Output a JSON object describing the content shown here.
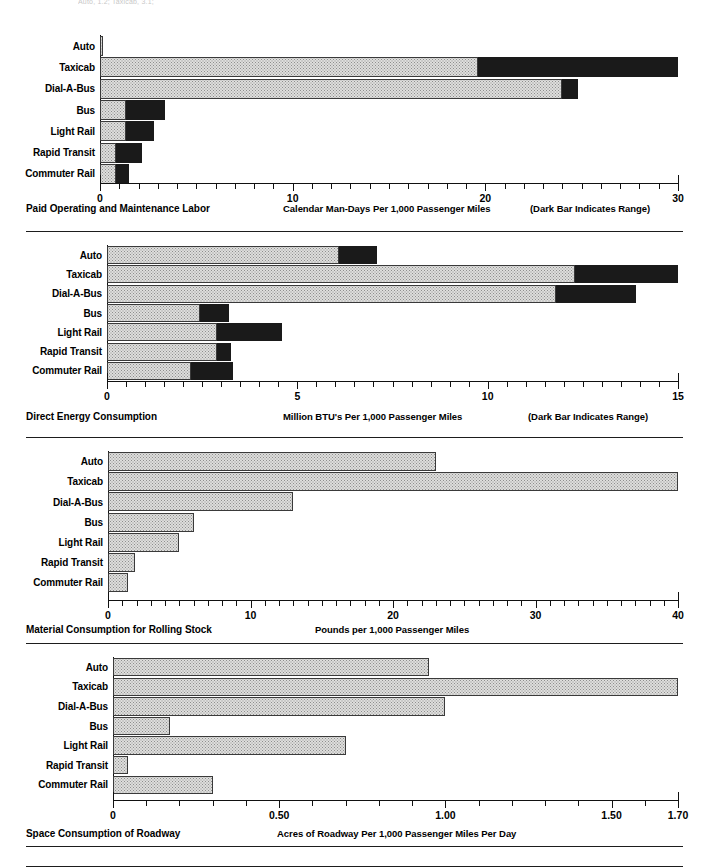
{
  "page": {
    "top_fragment": "Auto, 1.2; Taxicab, 3.1;"
  },
  "categories": [
    "Auto",
    "Taxicab",
    "Dial-A-Bus",
    "Bus",
    "Light Rail",
    "Rapid Transit",
    "Commuter Rail"
  ],
  "legend_note": "(Dark Bar Indicates Range)",
  "chart_data": [
    {
      "type": "bar",
      "orientation": "horizontal",
      "title": "Paid Operating and Maintenance Labor",
      "xlabel": "Calendar Man-Days Per 1,000 Passenger Miles",
      "legend_note": "(Dark Bar Indicates Range)",
      "ylabel": "",
      "xlim": [
        0,
        30
      ],
      "xticks": [
        0,
        10,
        20,
        30
      ],
      "xtick_labels": [
        "0",
        "10",
        "20",
        "30"
      ],
      "minor_tick_step": 1,
      "grid": false,
      "categories": [
        "Auto",
        "Taxicab",
        "Dial-A-Bus",
        "Bus",
        "Light Rail",
        "Rapid Transit",
        "Commuter Rail"
      ],
      "series": [
        {
          "name": "Low (light bar)",
          "values": [
            0.1,
            19.6,
            24.0,
            1.35,
            1.35,
            0.85,
            0.85
          ]
        },
        {
          "name": "High (dark bar end)",
          "values": [
            0.1,
            30.0,
            24.8,
            3.4,
            2.8,
            2.2,
            1.5
          ]
        }
      ]
    },
    {
      "type": "bar",
      "orientation": "horizontal",
      "title": "Direct Energy Consumption",
      "xlabel": "Million BTU's Per 1,000 Passenger Miles",
      "legend_note": "(Dark Bar Indicates Range)",
      "ylabel": "",
      "xlim": [
        0,
        15
      ],
      "xticks": [
        0,
        5,
        10,
        15
      ],
      "xtick_labels": [
        "0",
        "5",
        "10",
        "15"
      ],
      "minor_tick_step": 0.5,
      "grid": false,
      "categories": [
        "Auto",
        "Taxicab",
        "Dial-A-Bus",
        "Bus",
        "Light Rail",
        "Rapid Transit",
        "Commuter Rail"
      ],
      "series": [
        {
          "name": "Low (light bar)",
          "values": [
            6.1,
            12.3,
            11.8,
            2.45,
            2.9,
            2.9,
            2.2
          ]
        },
        {
          "name": "High (dark bar end)",
          "values": [
            7.1,
            15.0,
            13.9,
            3.2,
            4.6,
            3.25,
            3.3
          ]
        }
      ]
    },
    {
      "type": "bar",
      "orientation": "horizontal",
      "title": "Material Consumption for Rolling Stock",
      "xlabel": "Pounds per 1,000 Passenger Miles",
      "legend_note": "",
      "ylabel": "",
      "xlim": [
        0,
        40
      ],
      "xticks": [
        0,
        10,
        20,
        30,
        40
      ],
      "xtick_labels": [
        "0",
        "10",
        "20",
        "30",
        "40"
      ],
      "minor_tick_step": 1,
      "grid": false,
      "categories": [
        "Auto",
        "Taxicab",
        "Dial-A-Bus",
        "Bus",
        "Light Rail",
        "Rapid Transit",
        "Commuter Rail"
      ],
      "series": [
        {
          "name": "Value",
          "values": [
            23.0,
            40.0,
            13.0,
            6.0,
            5.0,
            1.9,
            1.4
          ]
        }
      ]
    },
    {
      "type": "bar",
      "orientation": "horizontal",
      "title": "Space Consumption of Roadway",
      "xlabel": "Acres of Roadway Per 1,000 Passenger Miles Per Day",
      "legend_note": "",
      "ylabel": "",
      "xlim": [
        0,
        1.7
      ],
      "xticks": [
        0,
        0.5,
        1.0,
        1.5,
        1.7
      ],
      "xtick_labels": [
        "0",
        "0.50",
        "1.00",
        "1.50",
        "1.70"
      ],
      "minor_tick_step": 0.1,
      "grid": false,
      "categories": [
        "Auto",
        "Taxicab",
        "Dial-A-Bus",
        "Bus",
        "Light Rail",
        "Rapid Transit",
        "Commuter Rail"
      ],
      "series": [
        {
          "name": "Value",
          "values": [
            0.95,
            1.7,
            1.0,
            0.17,
            0.7,
            0.045,
            0.3
          ]
        }
      ]
    }
  ]
}
